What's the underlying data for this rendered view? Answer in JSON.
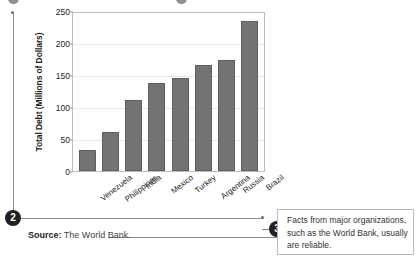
{
  "chart_data": {
    "type": "bar",
    "title": "",
    "xlabel": "",
    "ylabel": "Total Debt (Millions of Dollars)",
    "categories": [
      "Venezuela",
      "Philippines",
      "India",
      "Mexico",
      "Turkey",
      "Argentina",
      "Russia",
      "Brazil"
    ],
    "values": [
      34,
      62,
      113,
      140,
      147,
      167,
      176,
      237
    ],
    "ylim": [
      0,
      250
    ],
    "yticks": [
      0,
      50,
      100,
      150,
      200,
      250
    ],
    "grid": true,
    "legend": "none",
    "bar_color": "#737373",
    "bar_border_color": "#5e5e5e",
    "gridline_color": "#e8e8e8",
    "axis_color": "#bcbcbc"
  },
  "annotations": {
    "marker_2": "2",
    "marker_3": "3"
  },
  "source": {
    "label": "Source",
    "separator": ":",
    "text": "The World Bank."
  },
  "callout": {
    "text": "Facts from major organizations, such as the World Bank, usually are reliable."
  }
}
